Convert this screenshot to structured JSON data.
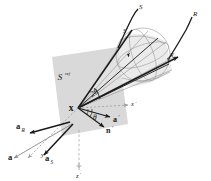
{
  "figure": {
    "width": 211,
    "height": 181,
    "background_color": "#ffffff"
  },
  "colors": {
    "surface_fill": "#d6d6d6",
    "cone_fill": "#e2e2e2",
    "ray_stroke": "#1a1a1a",
    "thin_stroke": "#8a8a8a",
    "dashed_stroke": "#9a9a9a",
    "label_color": "#1a1a1a",
    "sphere_stroke": "#8f8f8f"
  },
  "surface": {
    "label": "S",
    "superscript": "ref",
    "name": "reflecting-surface"
  },
  "vertex": {
    "label": "x",
    "name": "scattering-point"
  },
  "axes": [
    {
      "label": "x",
      "prime": "′",
      "name": "axis-x-prime",
      "style": "dashed"
    },
    {
      "label": "y",
      "prime": "′",
      "name": "axis-y-prime",
      "style": "dashed"
    },
    {
      "label": "z",
      "prime": "′",
      "name": "axis-z-prime",
      "style": "dashed"
    }
  ],
  "rays": [
    {
      "label": "S",
      "name": "source-ray",
      "description": "source path curve"
    },
    {
      "label": "R",
      "name": "receiver-ray",
      "description": "receiver path curve"
    }
  ],
  "sphere_points": [
    {
      "label": "S",
      "prime": "′",
      "name": "source-projection-point"
    },
    {
      "label": "R",
      "prime": "′",
      "name": "receiver-projection-point"
    }
  ],
  "angles": [
    {
      "label": "2θ",
      "name": "cone-aperture-angle"
    },
    {
      "label": "θ",
      "name": "incidence-angle"
    }
  ],
  "vectors": [
    {
      "label": "a",
      "prime": "′",
      "subscript": "",
      "name": "vector-a-prime"
    },
    {
      "label": "n",
      "prime": "′",
      "subscript": "",
      "name": "vector-n-prime"
    },
    {
      "label": "a",
      "prime": "",
      "subscript": "R",
      "name": "vector-a-R"
    },
    {
      "label": "a",
      "prime": "",
      "subscript": "",
      "name": "vector-a"
    },
    {
      "label": "a",
      "prime": "",
      "subscript": "S",
      "name": "vector-a-S"
    }
  ]
}
